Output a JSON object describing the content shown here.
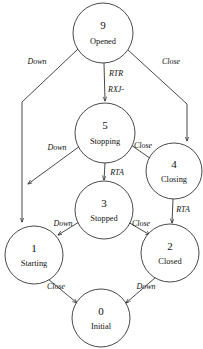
{
  "diagram": {
    "type": "state-transition-diagram",
    "colors": {
      "background": "#ffffff",
      "stroke": "#1a1a1a",
      "text": "#111111"
    },
    "nodes": [
      {
        "id": "9",
        "number": "9",
        "name": "Opened",
        "cx": 103,
        "cy": 33,
        "r": 30
      },
      {
        "id": "5",
        "number": "5",
        "name": "Stopping",
        "cx": 105,
        "cy": 133,
        "r": 30
      },
      {
        "id": "4",
        "number": "4",
        "name": "Closing",
        "cx": 174,
        "cy": 171,
        "r": 28
      },
      {
        "id": "3",
        "number": "3",
        "name": "Stopped",
        "cx": 104,
        "cy": 210,
        "r": 29
      },
      {
        "id": "1",
        "number": "1",
        "name": "Starting",
        "cx": 34,
        "cy": 255,
        "r": 29
      },
      {
        "id": "2",
        "number": "2",
        "name": "Closed",
        "cx": 170,
        "cy": 253,
        "r": 29
      },
      {
        "id": "0",
        "number": "0",
        "name": "Initial",
        "cx": 101,
        "cy": 318,
        "r": 29
      }
    ],
    "edges": [
      {
        "from": "9",
        "to": "1",
        "label": "Down",
        "label_x": 37,
        "label_y": 64
      },
      {
        "from": "9",
        "to": "5",
        "label": "RTR",
        "label_x": 115,
        "label_y": 76
      },
      {
        "from": "9",
        "to": "5",
        "label": "RXJ-",
        "label_x": 115,
        "label_y": 92
      },
      {
        "from": "9",
        "to": "4",
        "label": "Close",
        "label_x": 171,
        "label_y": 64
      },
      {
        "from": "5",
        "to": "1",
        "label": "Down",
        "label_x": 57,
        "label_y": 150
      },
      {
        "from": "5",
        "to": "4",
        "label": "Close",
        "label_x": 143,
        "label_y": 148
      },
      {
        "from": "5",
        "to": "3",
        "label": "RTA",
        "label_x": 115,
        "label_y": 174
      },
      {
        "from": "3",
        "to": "1",
        "label": "Down",
        "label_x": 62,
        "label_y": 226
      },
      {
        "from": "3",
        "to": "2",
        "label": "Close",
        "label_x": 141,
        "label_y": 226
      },
      {
        "from": "4",
        "to": "2",
        "label": "RTA",
        "label_x": 181,
        "label_y": 211
      },
      {
        "from": "1",
        "to": "0",
        "label": "Close",
        "label_x": 56,
        "label_y": 289
      },
      {
        "from": "2",
        "to": "0",
        "label": "Down",
        "label_x": 146,
        "label_y": 289
      }
    ]
  }
}
